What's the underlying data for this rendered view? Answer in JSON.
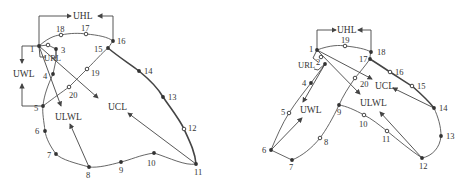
{
  "figure": {
    "left": {
      "labels": {
        "UHL": "UHL",
        "UWL": "UWL",
        "URL": "URL",
        "UCL": "UCL",
        "ULWL": "ULWL"
      },
      "points": [
        {
          "id": "1",
          "x": 39,
          "y": 46,
          "filled": true,
          "lx": 30,
          "ly": 52
        },
        {
          "id": "2",
          "x": 48,
          "y": 45,
          "filled": false,
          "lx": 0,
          "ly": 0
        },
        {
          "id": "3",
          "x": 56,
          "y": 49,
          "filled": true,
          "lx": 61,
          "ly": 53
        },
        {
          "id": "4",
          "x": 53,
          "y": 74,
          "filled": true,
          "lx": 43,
          "ly": 79
        },
        {
          "id": "5",
          "x": 43,
          "y": 106,
          "filled": true,
          "lx": 34,
          "ly": 111
        },
        {
          "id": "6",
          "x": 45,
          "y": 131,
          "filled": true,
          "lx": 35,
          "ly": 134
        },
        {
          "id": "7",
          "x": 56,
          "y": 154,
          "filled": true,
          "lx": 47,
          "ly": 158
        },
        {
          "id": "8",
          "x": 89,
          "y": 167,
          "filled": true,
          "lx": 86,
          "ly": 178
        },
        {
          "id": "9",
          "x": 121,
          "y": 162,
          "filled": true,
          "lx": 119,
          "ly": 173
        },
        {
          "id": "10",
          "x": 154,
          "y": 153,
          "filled": true,
          "lx": 147,
          "ly": 166
        },
        {
          "id": "11",
          "x": 196,
          "y": 164,
          "filled": true,
          "lx": 194,
          "ly": 175
        },
        {
          "id": "12",
          "x": 184,
          "y": 129,
          "filled": false,
          "lx": 188,
          "ly": 131
        },
        {
          "id": "13",
          "x": 163,
          "y": 97,
          "filled": true,
          "lx": 168,
          "ly": 100
        },
        {
          "id": "14",
          "x": 139,
          "y": 71,
          "filled": true,
          "lx": 144,
          "ly": 74
        },
        {
          "id": "15",
          "x": 108,
          "y": 48,
          "filled": true,
          "lx": 94,
          "ly": 52
        },
        {
          "id": "16",
          "x": 113,
          "y": 41,
          "filled": true,
          "lx": 117,
          "ly": 44
        },
        {
          "id": "17",
          "x": 86,
          "y": 34,
          "filled": false,
          "lx": 81,
          "ly": 31
        },
        {
          "id": "18",
          "x": 61,
          "y": 35,
          "filled": false,
          "lx": 56,
          "ly": 32
        },
        {
          "id": "19",
          "x": 87,
          "y": 69,
          "filled": false,
          "lx": 91,
          "ly": 76
        },
        {
          "id": "20",
          "x": 69,
          "y": 87,
          "filled": false,
          "lx": 69,
          "ly": 98
        }
      ]
    },
    "right": {
      "labels": {
        "UHL": "UHL",
        "URL": "URL",
        "UWL": "UWL",
        "UCL": "UCL",
        "ULWL": "ULWL"
      },
      "points": [
        {
          "id": "1",
          "x": 317,
          "y": 50,
          "filled": true,
          "lx": 309,
          "ly": 52
        },
        {
          "id": "2",
          "x": 321,
          "y": 57,
          "filled": false,
          "lx": 316,
          "ly": 65
        },
        {
          "id": "3",
          "x": 325,
          "y": 64,
          "filled": true,
          "lx": 0,
          "ly": 0
        },
        {
          "id": "4",
          "x": 311,
          "y": 83,
          "filled": true,
          "lx": 302,
          "ly": 86
        },
        {
          "id": "5",
          "x": 289,
          "y": 113,
          "filled": false,
          "lx": 281,
          "ly": 115
        },
        {
          "id": "6",
          "x": 271,
          "y": 150,
          "filled": true,
          "lx": 262,
          "ly": 153
        },
        {
          "id": "7",
          "x": 292,
          "y": 160,
          "filled": true,
          "lx": 289,
          "ly": 170
        },
        {
          "id": "8",
          "x": 320,
          "y": 138,
          "filled": false,
          "lx": 324,
          "ly": 145
        },
        {
          "id": "9",
          "x": 339,
          "y": 105,
          "filled": true,
          "lx": 337,
          "ly": 115
        },
        {
          "id": "10",
          "x": 364,
          "y": 115,
          "filled": false,
          "lx": 359,
          "ly": 127
        },
        {
          "id": "11",
          "x": 387,
          "y": 131,
          "filled": false,
          "lx": 382,
          "ly": 142
        },
        {
          "id": "12",
          "x": 422,
          "y": 158,
          "filled": true,
          "lx": 419,
          "ly": 169
        },
        {
          "id": "13",
          "x": 441,
          "y": 136,
          "filled": true,
          "lx": 446,
          "ly": 139
        },
        {
          "id": "14",
          "x": 434,
          "y": 108,
          "filled": true,
          "lx": 439,
          "ly": 111
        },
        {
          "id": "15",
          "x": 412,
          "y": 86,
          "filled": false,
          "lx": 417,
          "ly": 89
        },
        {
          "id": "16",
          "x": 390,
          "y": 72,
          "filled": false,
          "lx": 395,
          "ly": 75
        },
        {
          "id": "17",
          "x": 370,
          "y": 59,
          "filled": true,
          "lx": 359,
          "ly": 62
        },
        {
          "id": "18",
          "x": 371,
          "y": 52,
          "filled": true,
          "lx": 377,
          "ly": 55
        },
        {
          "id": "19",
          "x": 345,
          "y": 46,
          "filled": false,
          "lx": 341,
          "ly": 43
        },
        {
          "id": "20",
          "x": 355,
          "y": 78,
          "filled": false,
          "lx": 360,
          "ly": 87
        }
      ]
    }
  }
}
